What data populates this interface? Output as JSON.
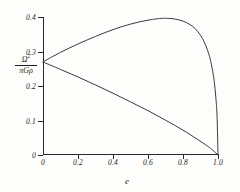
{
  "chart_data": {
    "type": "line",
    "title": "",
    "xlabel": "e",
    "ylabel": "Ω² / πGρ",
    "ylabel_numerator": "Ω",
    "ylabel_numerator_exp": "2",
    "ylabel_denominator": "πGρ",
    "xlim": [
      0,
      1.0
    ],
    "ylim": [
      0,
      0.4
    ],
    "grid": false,
    "legend": "none",
    "xticks": [
      0,
      0.2,
      0.4,
      0.6,
      0.8,
      1.0
    ],
    "xtick_labels": [
      "0",
      "0.2",
      "0.4",
      "0.6",
      "0.8",
      "1.0"
    ],
    "yticks": [
      0,
      0.1,
      0.2,
      0.3,
      0.4
    ],
    "ytick_labels": [
      "0",
      "0.1",
      "0.2",
      "0.3",
      "0.4"
    ],
    "bifurcation_point": {
      "e": 0.0,
      "value": 0.2696
    },
    "series": [
      {
        "name": "upper-branch",
        "x": [
          0.0,
          0.05,
          0.1,
          0.15,
          0.2,
          0.25,
          0.3,
          0.35,
          0.4,
          0.45,
          0.5,
          0.55,
          0.6,
          0.65,
          0.68,
          0.7,
          0.75,
          0.8,
          0.84,
          0.87,
          0.9,
          0.92,
          0.94,
          0.955,
          0.97,
          0.98,
          0.99,
          0.995,
          1.0
        ],
        "y": [
          0.2696,
          0.284,
          0.2975,
          0.31,
          0.3218,
          0.333,
          0.3438,
          0.354,
          0.3634,
          0.372,
          0.3794,
          0.3857,
          0.3908,
          0.3946,
          0.396,
          0.3962,
          0.3945,
          0.388,
          0.378,
          0.366,
          0.347,
          0.329,
          0.304,
          0.279,
          0.242,
          0.206,
          0.152,
          0.106,
          0.0
        ]
      },
      {
        "name": "lower-branch",
        "x": [
          0.0,
          0.1,
          0.2,
          0.3,
          0.4,
          0.5,
          0.6,
          0.7,
          0.8,
          0.88,
          0.94,
          0.97,
          1.0
        ],
        "y": [
          0.2696,
          0.248,
          0.2262,
          0.203,
          0.179,
          0.154,
          0.1285,
          0.101,
          0.072,
          0.0462,
          0.0258,
          0.014,
          0.0
        ]
      }
    ]
  }
}
